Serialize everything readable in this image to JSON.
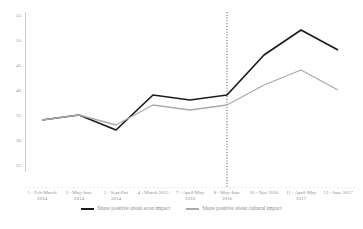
{
  "chart_data": {
    "type": "line",
    "title": "",
    "xlabel": "",
    "ylabel": "",
    "grid": false,
    "legend_position": "bottom",
    "y_ticks": [
      25,
      30,
      35,
      40,
      45,
      50,
      55
    ],
    "ylim": [
      23,
      57
    ],
    "x_tick_labels": [
      {
        "line1": "1 - Feb-March",
        "line2": "2014"
      },
      {
        "line1": "2 - May-June",
        "line2": "2014"
      },
      {
        "line1": "3 - Sept-Oct",
        "line2": "2014"
      },
      {
        "line1": "4 - March 2015",
        "line2": ""
      },
      {
        "line1": "7 - April-May",
        "line2": "2016"
      },
      {
        "line1": "8 - May-June",
        "line2": "2016"
      },
      {
        "line1": "10 - Nov 2016",
        "line2": ""
      },
      {
        "line1": "11 - April-May",
        "line2": "2017"
      },
      {
        "line1": "13 - June 2017",
        "line2": ""
      }
    ],
    "series": [
      {
        "name": "Share positive about econ impact",
        "color": "#1c1c1c",
        "values": [
          34,
          35,
          32,
          39,
          38,
          39,
          47,
          52,
          48
        ]
      },
      {
        "name": "Share positive about cultural impact",
        "color": "#aaaaaa",
        "values": [
          34,
          35,
          33,
          37,
          36,
          37,
          41,
          44,
          40
        ]
      }
    ],
    "reference_line": {
      "style": "vertical-dotted",
      "color": "#3c3c3c",
      "at_category_index": 5,
      "at_category": "8 - May-June 2016"
    },
    "axis_color": "#c9c9c9",
    "tick_text_color": "#8f8f8f"
  }
}
